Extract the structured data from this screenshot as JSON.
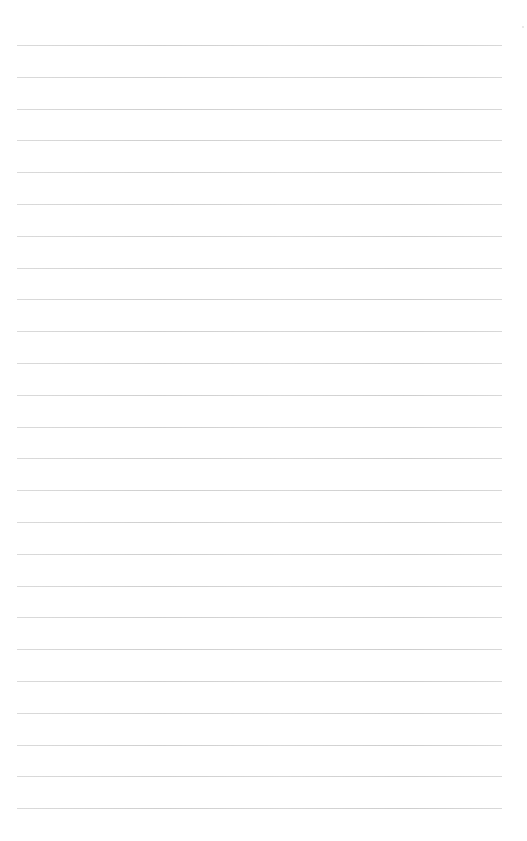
{
  "page": {
    "type": "lined-paper",
    "background_color": "#ffffff",
    "rule_color": "#cccccc",
    "rule_count": 25,
    "first_rule_y": 45,
    "rule_spacing": 31.8,
    "rule_left": 17,
    "rule_right": 502
  }
}
